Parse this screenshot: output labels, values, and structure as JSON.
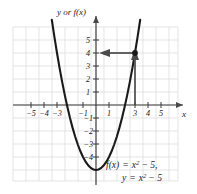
{
  "chart_data": {
    "type": "line",
    "title": "",
    "function_label": "f(x) = x",
    "xlabel": "x",
    "ylabel": "y or f(x)",
    "equations": [
      {
        "lhs": "f(x)",
        "eq": "=",
        "base": "x",
        "exp": "2",
        "rest": "− 5,"
      },
      {
        "lhs": "y",
        "eq": "=",
        "base": "x",
        "exp": "2",
        "rest": "− 5"
      }
    ],
    "xlim": [
      -6.2,
      6.2
    ],
    "ylim": [
      -6.4,
      6.2
    ],
    "grid": true,
    "xticks": [
      -5,
      -4,
      -3,
      -1,
      1,
      3,
      4,
      5
    ],
    "xtick_labels": [
      "−5",
      "−4",
      "−3",
      "−1",
      "1",
      "3",
      "4",
      "5"
    ],
    "yticks": [
      5,
      4,
      3,
      2,
      1,
      -1,
      -2,
      -3,
      -4
    ],
    "ytick_labels": [
      "5",
      "4",
      "3",
      "2",
      "1",
      "−1",
      "−2",
      "−3",
      "−4"
    ],
    "series": [
      {
        "name": "y = x^2 - 5",
        "expression": "x^2-5",
        "vertex": [
          0,
          -5
        ],
        "roots": [
          -2.236,
          2.236
        ],
        "x": [
          -3.4,
          -3.2,
          -3.0,
          -2.8,
          -2.6,
          -2.4,
          -2.2,
          -2.0,
          -1.8,
          -1.6,
          -1.4,
          -1.2,
          -1.0,
          -0.8,
          -0.6,
          -0.4,
          -0.2,
          0.0,
          0.2,
          0.4,
          0.6,
          0.8,
          1.0,
          1.2,
          1.4,
          1.6,
          1.8,
          2.0,
          2.2,
          2.4,
          2.6,
          2.8,
          3.0,
          3.2,
          3.4
        ],
        "y": [
          6.56,
          5.24,
          4.0,
          2.84,
          1.76,
          0.76,
          -0.16,
          -1.0,
          -1.76,
          -2.44,
          -3.04,
          -3.56,
          -4.0,
          -4.36,
          -4.64,
          -4.84,
          -4.96,
          -5.0,
          -4.96,
          -4.84,
          -4.64,
          -4.36,
          -4.0,
          -3.56,
          -3.04,
          -2.44,
          -1.76,
          -1.0,
          -0.16,
          0.76,
          1.76,
          2.84,
          4.0,
          5.24,
          6.56
        ]
      }
    ],
    "annotations": [
      {
        "name": "point",
        "x": 3,
        "y": 4,
        "marker": "filled-circle"
      },
      {
        "name": "vertical-arrow",
        "from": [
          3,
          0
        ],
        "to": [
          3,
          4
        ],
        "direction": "up"
      },
      {
        "name": "horizontal-arrow",
        "from": [
          3,
          4
        ],
        "to": [
          0.15,
          4
        ],
        "direction": "left"
      }
    ]
  }
}
